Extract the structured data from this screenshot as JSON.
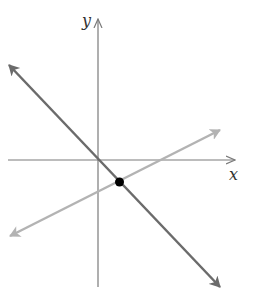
{
  "diagram": {
    "x_axis_label": "x",
    "y_axis_label": "y",
    "colors": {
      "axes": "#7a7a7a",
      "line_dark": "#6b6b6b",
      "line_light": "#b3b3b3",
      "point": "#000000"
    },
    "lines": [
      {
        "name": "decreasing-line",
        "description": "line through origin with negative slope"
      },
      {
        "name": "increasing-line",
        "description": "line with positive slope and negative y-intercept"
      }
    ],
    "intersection_point": {
      "description": "intersection of the two lines, in quadrant IV"
    }
  }
}
